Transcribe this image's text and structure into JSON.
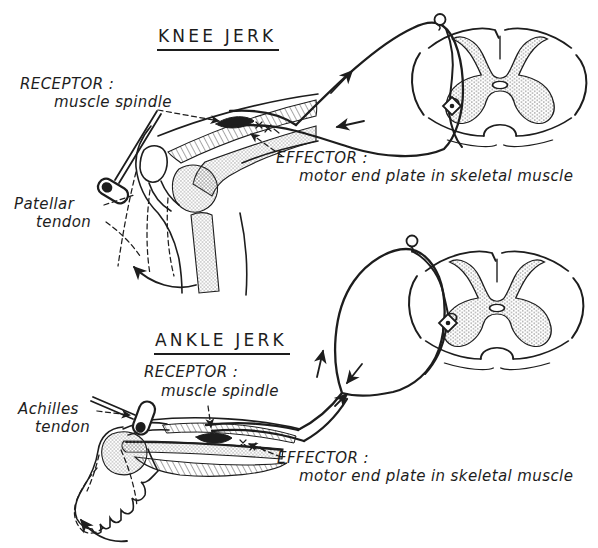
{
  "figure": {
    "ink_color": "#1d1d1d",
    "paper_color": "#ffffff"
  },
  "knee_jerk": {
    "title": "KNEE JERK",
    "receptor": {
      "label": "RECEPTOR :",
      "value": "muscle spindle"
    },
    "effector": {
      "label": "EFFECTOR :",
      "value": "motor end plate in skeletal muscle"
    },
    "tendon": {
      "line1": "Patellar",
      "line2": "tendon"
    }
  },
  "ankle_jerk": {
    "title": "ANKLE JERK",
    "receptor": {
      "label": "RECEPTOR :",
      "value": "muscle spindle"
    },
    "effector": {
      "label": "EFFECTOR :",
      "value": "motor end plate in skeletal muscle"
    },
    "tendon": {
      "line1": "Achilles",
      "line2": "tendon"
    }
  }
}
